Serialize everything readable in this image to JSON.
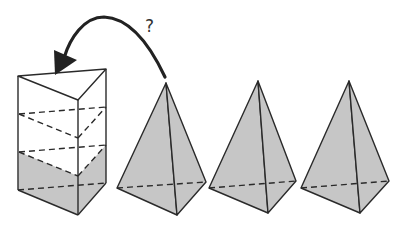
{
  "diagram": {
    "question_mark": "?",
    "colors": {
      "fill": "#c6c6c6",
      "stroke": "#2a2a2a",
      "background": "#ffffff"
    },
    "prism": {
      "shape": "triangular prism",
      "filled_fraction": "1/3",
      "level_dividers": 2
    },
    "pyramids": [
      {
        "shape": "triangular pyramid",
        "index": 1
      },
      {
        "shape": "triangular pyramid",
        "index": 2
      },
      {
        "shape": "triangular pyramid",
        "index": 3
      }
    ],
    "arrow": {
      "from": "pyramid-1",
      "to": "prism"
    }
  }
}
